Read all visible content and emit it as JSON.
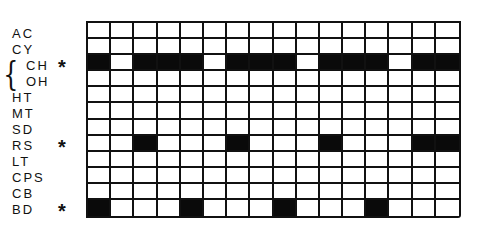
{
  "diagram": {
    "rows": [
      {
        "label": "AC",
        "marked": false,
        "cells": [
          0,
          0,
          0,
          0,
          0,
          0,
          0,
          0,
          0,
          0,
          0,
          0,
          0,
          0,
          0,
          0
        ]
      },
      {
        "label": "CY",
        "marked": false,
        "cells": [
          0,
          0,
          0,
          0,
          0,
          0,
          0,
          0,
          0,
          0,
          0,
          0,
          0,
          0,
          0,
          0
        ]
      },
      {
        "label": "CH",
        "marked": true,
        "cells": [
          1,
          0,
          1,
          1,
          1,
          0,
          1,
          1,
          1,
          0,
          1,
          1,
          1,
          0,
          1,
          1
        ]
      },
      {
        "label": "OH",
        "marked": false,
        "cells": [
          0,
          0,
          0,
          0,
          0,
          0,
          0,
          0,
          0,
          0,
          0,
          0,
          0,
          0,
          0,
          0
        ]
      },
      {
        "label": "HT",
        "marked": false,
        "cells": [
          0,
          0,
          0,
          0,
          0,
          0,
          0,
          0,
          0,
          0,
          0,
          0,
          0,
          0,
          0,
          0
        ]
      },
      {
        "label": "MT",
        "marked": false,
        "cells": [
          0,
          0,
          0,
          0,
          0,
          0,
          0,
          0,
          0,
          0,
          0,
          0,
          0,
          0,
          0,
          0
        ]
      },
      {
        "label": "SD",
        "marked": false,
        "cells": [
          0,
          0,
          0,
          0,
          0,
          0,
          0,
          0,
          0,
          0,
          0,
          0,
          0,
          0,
          0,
          0
        ]
      },
      {
        "label": "RS",
        "marked": true,
        "cells": [
          0,
          0,
          1,
          0,
          0,
          0,
          1,
          0,
          0,
          0,
          1,
          0,
          0,
          0,
          1,
          1
        ]
      },
      {
        "label": "LT",
        "marked": false,
        "cells": [
          0,
          0,
          0,
          0,
          0,
          0,
          0,
          0,
          0,
          0,
          0,
          0,
          0,
          0,
          0,
          0
        ]
      },
      {
        "label": "CPS",
        "marked": false,
        "cells": [
          0,
          0,
          0,
          0,
          0,
          0,
          0,
          0,
          0,
          0,
          0,
          0,
          0,
          0,
          0,
          0
        ]
      },
      {
        "label": "CB",
        "marked": false,
        "cells": [
          0,
          0,
          0,
          0,
          0,
          0,
          0,
          0,
          0,
          0,
          0,
          0,
          0,
          0,
          0,
          0
        ]
      },
      {
        "label": "BD",
        "marked": true,
        "cells": [
          1,
          0,
          0,
          0,
          1,
          0,
          0,
          0,
          1,
          0,
          0,
          0,
          1,
          0,
          0,
          0
        ]
      }
    ],
    "columns": 16,
    "marker_symbol": "*",
    "brace_symbol": "{",
    "brace_groups": [
      [
        "CH",
        "OH"
      ]
    ],
    "colors": {
      "filled": "#0a0a0a",
      "empty": "#ffffff",
      "line": "#111111"
    }
  }
}
